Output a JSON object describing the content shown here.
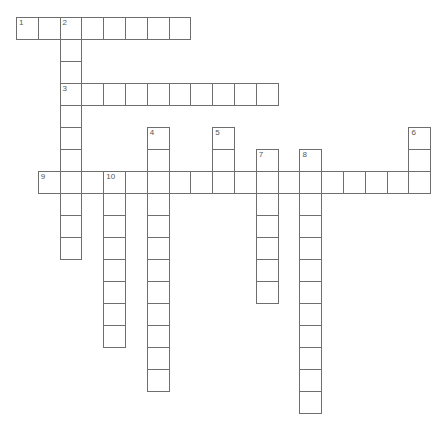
{
  "puzzle": {
    "type": "crossword",
    "origin": {
      "x": 16,
      "y": 17
    },
    "cell_w": 21.8,
    "cell_h": 22,
    "border_color": "#6e6e6e",
    "words": [
      {
        "number": "1",
        "direction": "across",
        "row": 0,
        "col": 0,
        "length": 8
      },
      {
        "number": "2",
        "direction": "down",
        "row": 0,
        "col": 2,
        "length": 11
      },
      {
        "number": "3",
        "direction": "across",
        "row": 3,
        "col": 2,
        "length": 10
      },
      {
        "number": "4",
        "direction": "down",
        "row": 5,
        "col": 6,
        "length": 12
      },
      {
        "number": "5",
        "direction": "down",
        "row": 5,
        "col": 9,
        "length": 3
      },
      {
        "number": "6",
        "direction": "down",
        "row": 5,
        "col": 18,
        "length": 3
      },
      {
        "number": "7",
        "direction": "down",
        "row": 6,
        "col": 11,
        "length": 7
      },
      {
        "number": "8",
        "direction": "down",
        "row": 6,
        "col": 13,
        "length": 12
      },
      {
        "number": "9",
        "direction": "across",
        "row": 7,
        "col": 1,
        "length": 18
      },
      {
        "number": "10",
        "direction": "down",
        "row": 7,
        "col": 4,
        "length": 8
      }
    ]
  }
}
